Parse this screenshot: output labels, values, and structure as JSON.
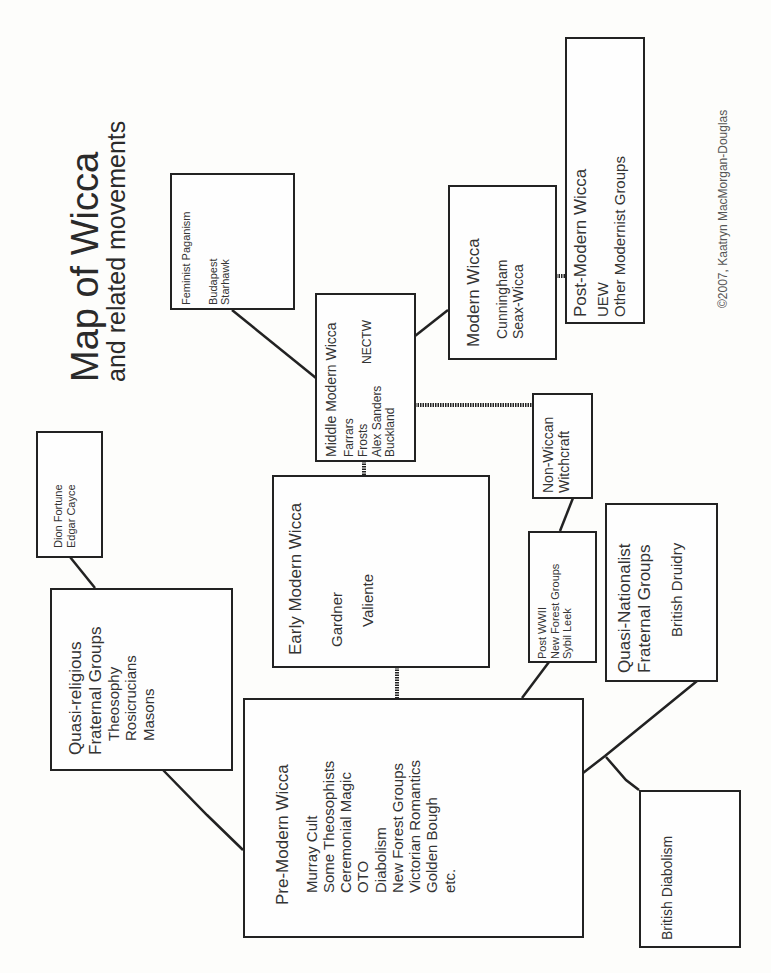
{
  "title": "Map of Wicca",
  "subtitle": "and related movements",
  "copyright": "©2007, Kaatryn MacMorgan-Douglas",
  "nodes": {
    "feminist": {
      "heading": "Feminist Paganism",
      "items": [
        "Budapest",
        "Starhawk"
      ]
    },
    "middle_modern": {
      "heading": "Middle Modern Wicca",
      "items": [
        "Farrars",
        "Frosts",
        "Alex Sanders",
        "Buckland"
      ],
      "side_item": "NECTW"
    },
    "modern": {
      "heading": "Modern Wicca",
      "items": [
        "Cunningham",
        "Seax-Wicca"
      ]
    },
    "post_modern": {
      "heading": "Post-Modern Wicca",
      "items": [
        "UEW",
        "Other Modernist Groups"
      ]
    },
    "dion": {
      "items": [
        "Dion Fortune",
        "Edgar Cayce"
      ]
    },
    "early_modern": {
      "heading": "Early Modern Wicca",
      "items": [
        "Gardner",
        "Valiente"
      ]
    },
    "non_wiccan": {
      "heading_lines": [
        "Non-Wiccan",
        "Witchcraft"
      ]
    },
    "quasi_religious": {
      "heading_lines": [
        "Quasi-religious",
        "Fraternal Groups"
      ],
      "items": [
        "Theosophy",
        "Rosicrucians",
        "Masons"
      ]
    },
    "post_wwii": {
      "items": [
        "Post WWII",
        "New Forest Groups",
        "Sybil Leek"
      ]
    },
    "quasi_nationalist": {
      "heading_lines": [
        "Quasi-Nationalist",
        "Fraternal Groups"
      ],
      "items": [
        "British Druidry"
      ]
    },
    "pre_modern": {
      "heading": "Pre-Modern Wicca",
      "items": [
        "Murray Cult",
        "Some Theosophists",
        "Ceremonial Magic",
        "OTO",
        "Diabolism",
        "New Forest Groups",
        "Victorian Romantics",
        "Golden Bough",
        "etc."
      ]
    },
    "british_diabolism": {
      "heading": "British Diabolism"
    }
  },
  "colors": {
    "line": "#222222",
    "text": "#333333",
    "background": "#fdfdfb"
  }
}
